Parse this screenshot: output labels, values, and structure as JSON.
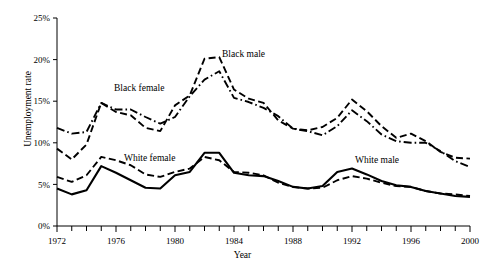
{
  "chart_data": {
    "type": "line",
    "title": "",
    "xlabel": "Year",
    "ylabel": "Unemployment rate",
    "xlim": [
      1972,
      2000
    ],
    "ylim": [
      0,
      25
    ],
    "grid": false,
    "legend_position": "inline-annotations",
    "x_major_ticks": [
      1972,
      1976,
      1980,
      1984,
      1988,
      1992,
      1996,
      2000
    ],
    "x_major_tick_labels": [
      "1972",
      "1976",
      "1980",
      "1984",
      "1988",
      "1992",
      "1996",
      "2000"
    ],
    "x_minor_tick_interval": 1,
    "y_ticks": [
      0,
      5,
      10,
      15,
      20,
      25
    ],
    "y_tick_labels": [
      "0%",
      "5%",
      "10%",
      "15%",
      "20%",
      "25%"
    ],
    "x": [
      1972,
      1973,
      1974,
      1975,
      1976,
      1977,
      1978,
      1979,
      1980,
      1981,
      1982,
      1983,
      1984,
      1985,
      1986,
      1987,
      1988,
      1989,
      1990,
      1991,
      1992,
      1993,
      1994,
      1995,
      1996,
      1997,
      1998,
      1999,
      2000
    ],
    "series": [
      {
        "name": "Black male",
        "line_style": "dashed",
        "color": "#000000",
        "values": [
          9.3,
          8.0,
          9.8,
          14.8,
          13.7,
          13.3,
          11.8,
          11.4,
          14.5,
          15.7,
          20.1,
          20.3,
          16.4,
          15.3,
          14.8,
          12.7,
          11.7,
          11.5,
          11.9,
          13.0,
          15.2,
          13.8,
          12.0,
          10.6,
          11.1,
          10.2,
          8.9,
          8.2,
          8.1
        ]
      },
      {
        "name": "Black female",
        "line_style": "dash-dot",
        "color": "#000000",
        "values": [
          11.8,
          11.1,
          11.3,
          14.8,
          14.0,
          14.0,
          13.1,
          12.3,
          13.1,
          15.6,
          17.6,
          18.6,
          15.4,
          14.9,
          14.2,
          13.2,
          11.7,
          11.4,
          10.9,
          12.0,
          13.9,
          12.6,
          11.0,
          10.2,
          10.0,
          10.0,
          9.0,
          7.8,
          7.1
        ]
      },
      {
        "name": "White female",
        "line_style": "dashed",
        "color": "#000000",
        "values": [
          5.9,
          5.3,
          6.1,
          8.3,
          7.9,
          7.3,
          6.2,
          5.9,
          6.5,
          6.9,
          8.3,
          7.9,
          6.5,
          6.4,
          6.1,
          5.2,
          4.7,
          4.5,
          4.6,
          5.5,
          6.0,
          5.7,
          5.2,
          4.8,
          4.7,
          4.2,
          3.9,
          3.8,
          3.6
        ]
      },
      {
        "name": "White male",
        "line_style": "solid",
        "color": "#000000",
        "values": [
          4.5,
          3.8,
          4.3,
          7.2,
          6.4,
          5.5,
          4.6,
          4.5,
          6.1,
          6.5,
          8.8,
          8.8,
          6.4,
          6.1,
          6.0,
          5.4,
          4.7,
          4.5,
          4.8,
          6.5,
          6.9,
          6.2,
          5.4,
          4.9,
          4.7,
          4.2,
          3.9,
          3.6,
          3.5
        ]
      }
    ],
    "annotations": [
      {
        "text": "Black male",
        "x_px": 222,
        "y_px": 57
      },
      {
        "text": "Black female",
        "x_px": 114,
        "y_px": 91
      },
      {
        "text": "White female",
        "x_px": 124,
        "y_px": 161
      },
      {
        "text": "White male",
        "x_px": 355,
        "y_px": 163
      }
    ]
  }
}
